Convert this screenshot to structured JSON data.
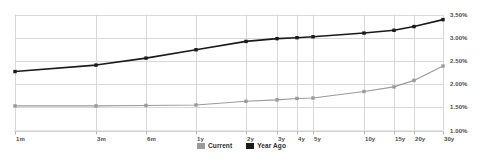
{
  "chart_data": {
    "type": "line",
    "title": "",
    "xlabel": "",
    "ylabel": "",
    "grid": true,
    "legend_position": "bottom-center",
    "categories": [
      "1m",
      "3m",
      "6m",
      "1y",
      "2y",
      "3y",
      "4y",
      "5y",
      "10y",
      "15y",
      "20y",
      "30y"
    ],
    "ytick_labels": [
      "3.50%",
      "3.00%",
      "2.50%",
      "2.00%",
      "1.50%",
      "1.00%"
    ],
    "ytick_values": [
      3.5,
      3.0,
      2.5,
      2.0,
      1.5,
      1.0
    ],
    "ylim": [
      1.0,
      3.5
    ],
    "series": [
      {
        "name": "Current",
        "color": "#9a9a9a",
        "values": [
          1.53,
          1.53,
          1.54,
          1.55,
          1.63,
          1.66,
          1.69,
          1.7,
          1.84,
          1.94,
          2.08,
          2.39
        ]
      },
      {
        "name": "Year Ago",
        "color": "#1a1a1a",
        "values": [
          2.27,
          2.41,
          2.56,
          2.74,
          2.92,
          2.98,
          3.0,
          3.02,
          3.1,
          3.16,
          3.24,
          3.39
        ]
      }
    ]
  },
  "legend": {
    "items": [
      {
        "label": "Current",
        "color": "#9a9a9a"
      },
      {
        "label": "Year Ago",
        "color": "#1a1a1a"
      }
    ]
  },
  "axis": {
    "y_labels": [
      "3.50%",
      "3.00%",
      "2.50%",
      "2.00%",
      "1.50%",
      "1.00%"
    ],
    "x_labels": [
      "1m",
      "3m",
      "6m",
      "1y",
      "2y",
      "3y",
      "4y",
      "5y",
      "10y",
      "15y",
      "20y",
      "30y"
    ]
  }
}
